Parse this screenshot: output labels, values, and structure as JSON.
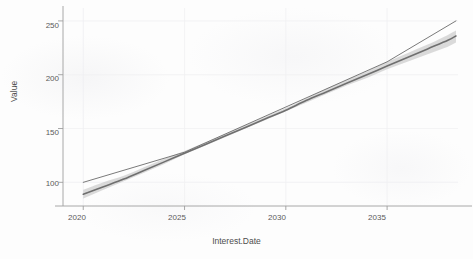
{
  "title": "",
  "axes": {
    "x_label": "Interest.Date",
    "y_label": "Value"
  },
  "ticks": {
    "x": [
      "2020",
      "2025",
      "2030",
      "2035"
    ],
    "y": [
      "250",
      "200",
      "150",
      "100"
    ]
  },
  "colors": {
    "fit_line": "#707070",
    "ribbon": "#b8b8b8",
    "straight_line": "#6e6e6e",
    "axis": "#9e9e9e",
    "grid": "#f0f0f2",
    "background": "#fdfdfd",
    "tick_text": "#5a5a5a"
  },
  "chart_data": {
    "type": "line",
    "title": "",
    "xlabel": "Interest.Date",
    "ylabel": "Value",
    "xlim": [
      2019.0,
      2038.5
    ],
    "ylim": [
      78,
      262
    ],
    "grid": true,
    "legend": "none",
    "xticks": [
      2020,
      2025,
      2030,
      2035
    ],
    "yticks": [
      100,
      150,
      200,
      250
    ],
    "series": [
      {
        "name": "fitted curve (with confidence ribbon)",
        "style": "line-with-ribbon",
        "color": "#707070",
        "x": [
          2020,
          2021,
          2022,
          2023,
          2024,
          2025,
          2026,
          2027,
          2028,
          2029,
          2030,
          2031,
          2032,
          2033,
          2034,
          2035,
          2036,
          2037,
          2038,
          2038.4
        ],
        "values": [
          89,
          96,
          103,
          111,
          119,
          127,
          135,
          143,
          151,
          159,
          167,
          176,
          184,
          192,
          200,
          208,
          216,
          224,
          232,
          236
        ],
        "ci_lower": [
          85,
          93,
          101,
          109,
          117,
          126,
          134,
          142,
          150,
          158,
          166,
          174,
          182,
          190,
          197,
          205,
          212,
          219,
          226,
          230
        ],
        "ci_upper": [
          93,
          100,
          106,
          114,
          122,
          129,
          137,
          145,
          153,
          161,
          169,
          178,
          187,
          195,
          203,
          212,
          220,
          228,
          237,
          241
        ]
      },
      {
        "name": "linear fit",
        "style": "line",
        "color": "#6e6e6e",
        "x": [
          2020,
          2025,
          2030,
          2035,
          2038.4
        ],
        "values": [
          100,
          128,
          170,
          212,
          250
        ]
      }
    ]
  }
}
